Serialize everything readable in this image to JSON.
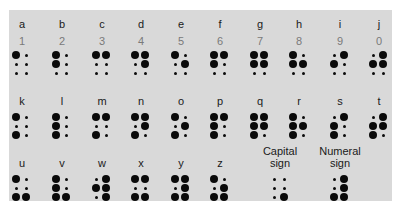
{
  "colors": {
    "panel": "#d9d9d9",
    "dot": "#0a0a0a",
    "letter": "#1a1a1a",
    "numeral": "#7a7a7a"
  },
  "rows": [
    {
      "label_y": 18,
      "num_y": 35,
      "dots_y": 51,
      "cells": [
        {
          "letter": "a",
          "numeral": "1",
          "x": 22,
          "dots": [
            1,
            0,
            0,
            0,
            0,
            0
          ]
        },
        {
          "letter": "b",
          "numeral": "2",
          "x": 62,
          "dots": [
            1,
            0,
            1,
            0,
            0,
            0
          ]
        },
        {
          "letter": "c",
          "numeral": "3",
          "x": 102,
          "dots": [
            1,
            1,
            0,
            0,
            0,
            0
          ]
        },
        {
          "letter": "d",
          "numeral": "4",
          "x": 141,
          "dots": [
            1,
            1,
            0,
            1,
            0,
            0
          ]
        },
        {
          "letter": "e",
          "numeral": "5",
          "x": 181,
          "dots": [
            1,
            0,
            0,
            1,
            0,
            0
          ]
        },
        {
          "letter": "f",
          "numeral": "6",
          "x": 220,
          "dots": [
            1,
            1,
            1,
            0,
            0,
            0
          ]
        },
        {
          "letter": "g",
          "numeral": "7",
          "x": 260,
          "dots": [
            1,
            1,
            1,
            1,
            0,
            0
          ]
        },
        {
          "letter": "h",
          "numeral": "8",
          "x": 299,
          "dots": [
            1,
            0,
            1,
            1,
            0,
            0
          ]
        },
        {
          "letter": "i",
          "numeral": "9",
          "x": 340,
          "dots": [
            0,
            1,
            1,
            0,
            0,
            0
          ]
        },
        {
          "letter": "j",
          "numeral": "0",
          "x": 379,
          "dots": [
            0,
            1,
            1,
            1,
            0,
            0
          ]
        }
      ]
    },
    {
      "label_y": 95,
      "num_y": null,
      "dots_y": 113,
      "cells": [
        {
          "letter": "k",
          "x": 22,
          "dots": [
            1,
            0,
            0,
            0,
            1,
            0
          ]
        },
        {
          "letter": "l",
          "x": 62,
          "dots": [
            1,
            0,
            1,
            0,
            1,
            0
          ]
        },
        {
          "letter": "m",
          "x": 102,
          "dots": [
            1,
            1,
            0,
            0,
            1,
            0
          ]
        },
        {
          "letter": "n",
          "x": 141,
          "dots": [
            1,
            1,
            0,
            1,
            1,
            0
          ]
        },
        {
          "letter": "o",
          "x": 181,
          "dots": [
            1,
            0,
            0,
            1,
            1,
            0
          ]
        },
        {
          "letter": "p",
          "x": 220,
          "dots": [
            1,
            1,
            1,
            0,
            1,
            0
          ]
        },
        {
          "letter": "q",
          "x": 260,
          "dots": [
            1,
            1,
            1,
            1,
            1,
            0
          ]
        },
        {
          "letter": "r",
          "x": 299,
          "dots": [
            1,
            0,
            1,
            1,
            1,
            0
          ]
        },
        {
          "letter": "s",
          "x": 340,
          "dots": [
            0,
            1,
            1,
            0,
            1,
            0
          ]
        },
        {
          "letter": "t",
          "x": 379,
          "dots": [
            0,
            1,
            1,
            1,
            1,
            0
          ]
        }
      ]
    },
    {
      "label_y": 157,
      "num_y": null,
      "dots_y": 175,
      "cells": [
        {
          "letter": "u",
          "x": 22,
          "dots": [
            1,
            0,
            0,
            0,
            1,
            1
          ]
        },
        {
          "letter": "v",
          "x": 62,
          "dots": [
            1,
            0,
            1,
            0,
            1,
            1
          ]
        },
        {
          "letter": "w",
          "x": 102,
          "dots": [
            0,
            1,
            1,
            1,
            0,
            1
          ]
        },
        {
          "letter": "x",
          "x": 141,
          "dots": [
            1,
            1,
            0,
            0,
            1,
            1
          ]
        },
        {
          "letter": "y",
          "x": 181,
          "dots": [
            1,
            1,
            0,
            1,
            1,
            1
          ]
        },
        {
          "letter": "z",
          "x": 220,
          "dots": [
            1,
            0,
            0,
            1,
            1,
            1
          ]
        }
      ]
    }
  ],
  "signs": [
    {
      "line1": "Capital",
      "line2": "sign",
      "x": 280,
      "label_y": 145,
      "dots_y": 175,
      "dots": [
        0,
        0,
        0,
        0,
        0,
        1
      ]
    },
    {
      "line1": "Numeral",
      "line2": "sign",
      "x": 340,
      "label_y": 145,
      "dots_y": 175,
      "dots": [
        0,
        1,
        0,
        1,
        1,
        1
      ]
    }
  ]
}
